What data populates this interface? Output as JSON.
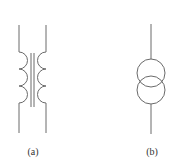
{
  "figure": {
    "panels": [
      {
        "id": "a",
        "label": "(a)",
        "symbol": "transformer-coil-symbol",
        "description": "Two inductor windings with three turns each facing an iron core drawn as two parallel lines"
      },
      {
        "id": "b",
        "label": "(b)",
        "symbol": "transformer-circle-symbol",
        "description": "Two overlapping circles on a vertical line"
      }
    ],
    "colors": {
      "stroke": "#6a6a6a",
      "text": "#333333",
      "background": "#ffffff"
    }
  }
}
